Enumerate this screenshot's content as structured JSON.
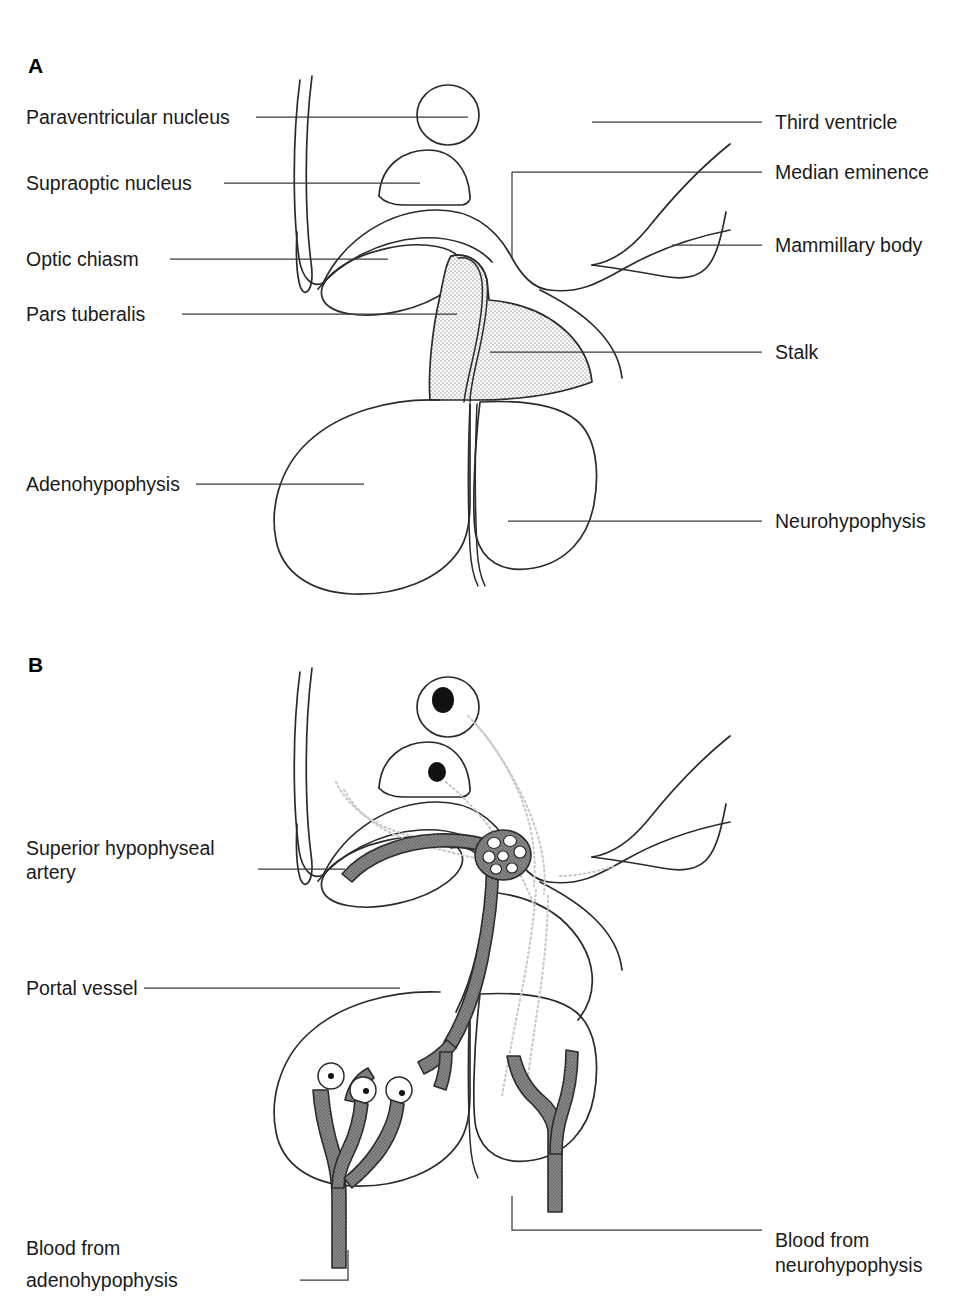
{
  "figure": {
    "background_color": "#ffffff",
    "line_color": "#2b2b2b",
    "leader_color": "#3a3a3a",
    "stipple_color": "#b4b4b4",
    "vessel_color": "#8a8a8a",
    "nucleus_color": "#111111",
    "tract_color": "#c9c9c9"
  },
  "panel_a": {
    "letter": "A",
    "labels_left": [
      {
        "id": "paraventricular-nucleus",
        "text": "Paraventricular nucleus"
      },
      {
        "id": "supraoptic-nucleus",
        "text": "Supraoptic nucleus"
      },
      {
        "id": "optic-chiasm",
        "text": "Optic chiasm"
      },
      {
        "id": "pars-tuberalis",
        "text": "Pars tuberalis"
      },
      {
        "id": "adenohypophysis",
        "text": "Adenohypophysis"
      }
    ],
    "labels_right": [
      {
        "id": "third-ventricle",
        "text": "Third ventricle"
      },
      {
        "id": "median-eminence",
        "text": "Median eminence"
      },
      {
        "id": "mammillary-body",
        "text": "Mammillary body"
      },
      {
        "id": "stalk",
        "text": "Stalk"
      },
      {
        "id": "neurohypophysis",
        "text": "Neurohypophysis"
      }
    ]
  },
  "panel_b": {
    "letter": "B",
    "labels_left": [
      {
        "id": "superior-hypophyseal-artery",
        "line1": "Superior hypophyseal",
        "line2": "artery"
      },
      {
        "id": "portal-vessel",
        "line1": "Portal vessel",
        "line2": ""
      },
      {
        "id": "blood-from-adenohypophysis",
        "line1": "Blood from",
        "line2": "adenohypophysis"
      }
    ],
    "labels_right": [
      {
        "id": "blood-from-neurohypophysis",
        "line1": "Blood from",
        "line2": "neurohypophysis"
      }
    ]
  }
}
